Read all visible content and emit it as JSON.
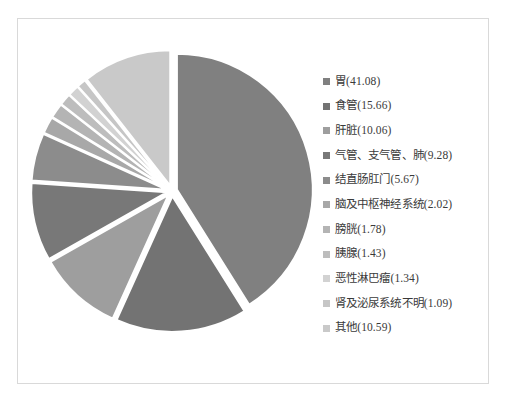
{
  "chart_data": {
    "type": "pie",
    "title": "",
    "legend_position": "right",
    "grid": false,
    "units": "percent",
    "categories": [
      "胃",
      "食管",
      "肝脏",
      "气管、支气管、肺",
      "结直肠肛门",
      "脑及中枢神经系统",
      "膀胱",
      "胰腺",
      "恶性淋巴瘤",
      "肾及泌尿系统不明",
      "其他"
    ],
    "values": [
      41.08,
      15.66,
      10.06,
      9.28,
      5.67,
      2.02,
      1.78,
      1.43,
      1.34,
      1.09,
      10.59
    ],
    "colors": [
      "#808080",
      "#737373",
      "#9e9e9e",
      "#787878",
      "#8c8c8c",
      "#a8a8a8",
      "#b4b4b4",
      "#bdbdbd",
      "#d2d2d2",
      "#c6c6c6",
      "#c9c9c9"
    ],
    "legend_entries": [
      {
        "label": "胃(41.08)",
        "color": "#808080"
      },
      {
        "label": "食管(15.66)",
        "color": "#737373"
      },
      {
        "label": "肝脏(10.06)",
        "color": "#9e9e9e"
      },
      {
        "label": "气管、支气管、肺(9.28)",
        "color": "#787878"
      },
      {
        "label": "结直肠肛门(5.67)",
        "color": "#8c8c8c"
      },
      {
        "label": "脑及中枢神经系统(2.02)",
        "color": "#a8a8a8"
      },
      {
        "label": "膀胱(1.78)",
        "color": "#b4b4b4"
      },
      {
        "label": "胰腺(1.43)",
        "color": "#bdbdbd"
      },
      {
        "label": "恶性淋巴瘤(1.34)",
        "color": "#d2d2d2"
      },
      {
        "label": "肾及泌尿系统不明(1.09)",
        "color": "#c6c6c6"
      },
      {
        "label": "其他(10.59)",
        "color": "#c9c9c9"
      }
    ]
  }
}
